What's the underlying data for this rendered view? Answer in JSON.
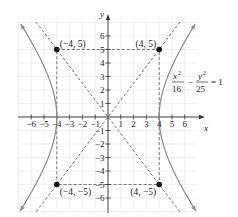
{
  "chart_data": {
    "type": "line",
    "title": "",
    "equation": "x^2/16 - y^2/25 = 1",
    "equation_parts": {
      "term1_num": "x",
      "term1_exp": "2",
      "term1_den": "16",
      "minus": "−",
      "term2_num": "y",
      "term2_exp": "2",
      "term2_den": "25",
      "rhs": "= 1"
    },
    "xlabel": "x",
    "ylabel": "y",
    "xlim": [
      -7,
      7
    ],
    "ylim": [
      -7,
      7.5
    ],
    "grid": true,
    "x_ticks": [
      -6,
      -5,
      -4,
      -3,
      -2,
      -1,
      1,
      2,
      3,
      4,
      5,
      6
    ],
    "y_ticks": [
      -6,
      -5,
      -4,
      -3,
      -2,
      -1,
      1,
      2,
      3,
      4,
      5,
      6
    ],
    "x_tick_labels": [
      "−6",
      "−5",
      "−4",
      "−3",
      "−2",
      "−1",
      "1",
      "2",
      "3",
      "4",
      "5",
      "6"
    ],
    "y_tick_labels": [
      "−6",
      "−5",
      "−4",
      "−3",
      "−2",
      "−1",
      "1",
      "2",
      "3",
      "4",
      "5",
      "6"
    ],
    "series": [
      {
        "name": "hyperbola",
        "style": "solid",
        "color": "#8a8a8a",
        "description": "x^2/16 - y^2/25 = 1, vertices (±4, 0)"
      },
      {
        "name": "asymptote y = 5x/4",
        "style": "dashed",
        "color": "#555555"
      },
      {
        "name": "asymptote y = -5x/4",
        "style": "dashed",
        "color": "#555555"
      },
      {
        "name": "fundamental rectangle",
        "style": "dashed",
        "color": "#555555",
        "corners": [
          [
            -4,
            5
          ],
          [
            4,
            5
          ],
          [
            4,
            -5
          ],
          [
            -4,
            -5
          ]
        ]
      }
    ],
    "points": [
      {
        "x": -4,
        "y": 5,
        "label": "(−4, 5)"
      },
      {
        "x": 4,
        "y": 5,
        "label": "(4, 5)"
      },
      {
        "x": -4,
        "y": -5,
        "label": "(−4, −5)"
      },
      {
        "x": 4,
        "y": -5,
        "label": "(4, −5)"
      }
    ]
  }
}
